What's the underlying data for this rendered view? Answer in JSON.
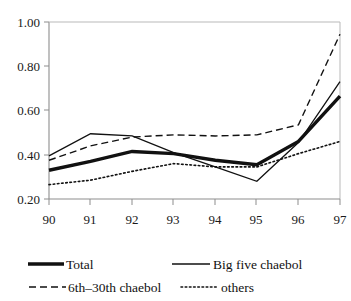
{
  "chart_data": {
    "type": "line",
    "title": "",
    "xlabel": "",
    "ylabel": "",
    "categories": [
      "90",
      "91",
      "92",
      "93",
      "94",
      "95",
      "96",
      "97"
    ],
    "x_tick_labels": [
      "90",
      "91",
      "92",
      "93",
      "94",
      "95",
      "96",
      "97"
    ],
    "y_tick_labels": [
      "1.00",
      "0.80",
      "0.60",
      "0.40",
      "0.20"
    ],
    "y_ticks": [
      1.0,
      0.8,
      0.6,
      0.4,
      0.2
    ],
    "ylim": [
      0.2,
      1.0
    ],
    "grid": false,
    "legend_position": "bottom",
    "series": [
      {
        "name": "Total",
        "style": "thick-solid",
        "color": "#111111",
        "values": [
          0.33,
          0.37,
          0.415,
          0.405,
          0.375,
          0.355,
          0.46,
          0.665
        ]
      },
      {
        "name": "Big five chaebol",
        "style": "solid",
        "color": "#111111",
        "values": [
          0.395,
          0.495,
          0.485,
          0.41,
          0.345,
          0.28,
          0.455,
          0.73
        ]
      },
      {
        "name": "6th–30th chaebol",
        "style": "dashed",
        "color": "#111111",
        "values": [
          0.375,
          0.44,
          0.48,
          0.49,
          0.485,
          0.49,
          0.535,
          0.945
        ]
      },
      {
        "name": "others",
        "style": "dotted",
        "color": "#111111",
        "values": [
          0.265,
          0.285,
          0.325,
          0.36,
          0.345,
          0.345,
          0.405,
          0.46
        ]
      }
    ]
  },
  "legend": {
    "entries": [
      {
        "label": "Total",
        "style": "thick-solid"
      },
      {
        "label": "Big five chaebol",
        "style": "solid"
      },
      {
        "label": "6th–30th chaebol",
        "style": "dashed"
      },
      {
        "label": "others",
        "style": "dotted"
      }
    ]
  },
  "axes": {
    "y_labels": [
      "1.00",
      "0.80",
      "0.60",
      "0.40",
      "0.20"
    ],
    "x_labels": [
      "90",
      "91",
      "92",
      "93",
      "94",
      "95",
      "96",
      "97"
    ]
  }
}
